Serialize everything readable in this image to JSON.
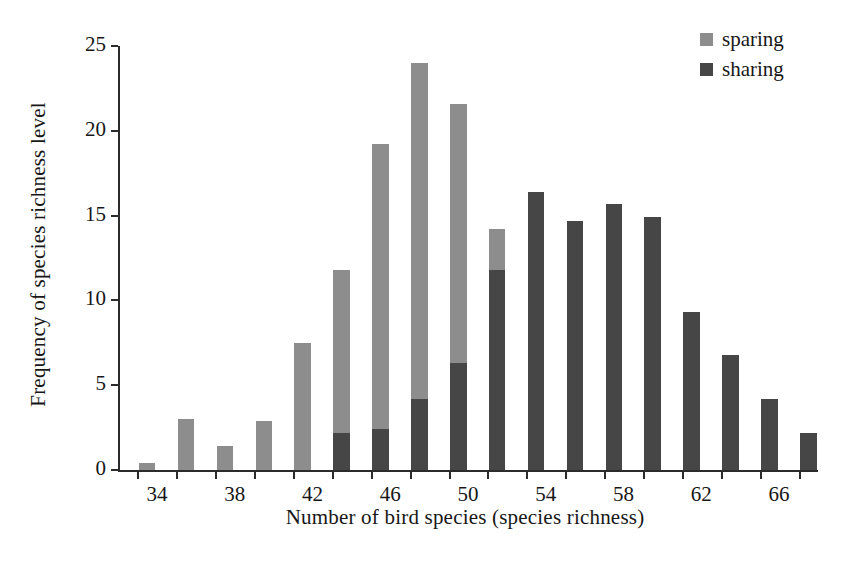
{
  "chart_data": {
    "type": "bar",
    "title": "",
    "subtitle": "",
    "xlabel": "Number of bird species (species richness)",
    "ylabel": "Frequency of species richness level",
    "xlim": [
      33,
      69
    ],
    "ylim": [
      0,
      25
    ],
    "yticks": [
      0,
      5,
      10,
      15,
      20,
      25
    ],
    "ytick_labels": [
      "0",
      "5",
      "10",
      "15",
      "20",
      "25"
    ],
    "xticks": [
      34,
      36,
      38,
      40,
      42,
      44,
      46,
      48,
      50,
      52,
      54,
      56,
      58,
      60,
      62,
      64,
      66,
      68
    ],
    "xtick_labels_major": [
      "34",
      "38",
      "42",
      "46",
      "50",
      "54",
      "58",
      "62",
      "66"
    ],
    "xticks_major": [
      34,
      38,
      42,
      46,
      50,
      54,
      58,
      62,
      66
    ],
    "grid": false,
    "legend_position": "top-right",
    "bar_width_units": 0.85,
    "series": [
      {
        "name": "sparing",
        "color": "#8d8d8d",
        "x": [
          34,
          36,
          38,
          40,
          42,
          44,
          46,
          48,
          50,
          52,
          54
        ],
        "values": [
          0.4,
          3.0,
          1.4,
          2.9,
          7.5,
          11.8,
          19.2,
          24.0,
          21.6,
          14.2,
          2.2
        ]
      },
      {
        "name": "sharing",
        "color": "#464646",
        "x": [
          44,
          46,
          48,
          50,
          52,
          54,
          56,
          58,
          60,
          62,
          64,
          66,
          68
        ],
        "values": [
          2.2,
          2.4,
          4.2,
          6.3,
          11.8,
          16.4,
          14.7,
          15.7,
          14.9,
          9.3,
          6.8,
          4.2,
          2.2
        ]
      }
    ]
  },
  "legend": {
    "entries": [
      {
        "label": "sparing",
        "color": "#8d8d8d"
      },
      {
        "label": "sharing",
        "color": "#464646"
      }
    ]
  }
}
